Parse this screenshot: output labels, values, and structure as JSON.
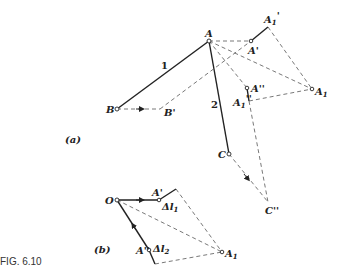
{
  "figure": {
    "caption": "FIG. 6.10",
    "part_a_label": "(a)",
    "part_b_label": "(b)"
  },
  "part_a": {
    "points": {
      "A": "A",
      "B": "B",
      "B_prime": "B'",
      "A_prime": "A'",
      "A1_prime": "A'1",
      "A_double_prime": "A''",
      "A1_double_prime": "A''1",
      "A1": "A1",
      "C": "C",
      "C_double_prime": "C''"
    },
    "members": {
      "bar1": "1",
      "bar2": "2"
    }
  },
  "part_b": {
    "points": {
      "O": "O",
      "A_prime": "A'",
      "A_double_prime": "A''",
      "A1": "A1"
    },
    "deltas": {
      "dl1": "Δl",
      "dl1_sub": "1",
      "dl2": "Δl",
      "dl2_sub": "2"
    }
  }
}
